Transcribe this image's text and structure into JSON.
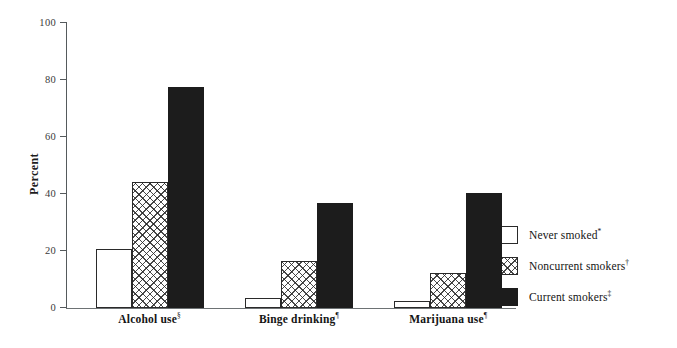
{
  "chart_data": {
    "type": "bar",
    "title": "",
    "xlabel": "",
    "ylabel": "Percent",
    "ylim": [
      0,
      100
    ],
    "yticks": [
      0,
      20,
      40,
      60,
      80,
      100
    ],
    "grid": false,
    "legend_position": "right",
    "categories": [
      {
        "label": "Alcohol use",
        "footnote": "§"
      },
      {
        "label": "Binge drinking",
        "footnote": "¶"
      },
      {
        "label": "Marijuana use",
        "footnote": "¶"
      }
    ],
    "series": [
      {
        "name": "Never smoked",
        "footnote": "*",
        "fill": "white",
        "color": "#ffffff",
        "values": [
          20.7,
          3.5,
          2.6
        ]
      },
      {
        "name": "Noncurrent smokers",
        "footnote": "†",
        "fill": "crosshatch",
        "color": "#ffffff",
        "values": [
          44.2,
          16.4,
          12.4
        ]
      },
      {
        "name": "Current smokers",
        "footnote": "‡",
        "fill": "solid",
        "color": "#1c1c1c",
        "values": [
          77.4,
          36.8,
          40.4
        ]
      }
    ]
  },
  "axis": {
    "y_title": "Percent",
    "tick_labels": [
      "0",
      "20",
      "40",
      "60",
      "80",
      "100"
    ]
  },
  "legend": {
    "items": [
      {
        "label": "Never smoked",
        "footnote": "*"
      },
      {
        "label": "Noncurrent smokers",
        "footnote": "†"
      },
      {
        "label": "Current smokers",
        "footnote": "‡"
      }
    ]
  }
}
